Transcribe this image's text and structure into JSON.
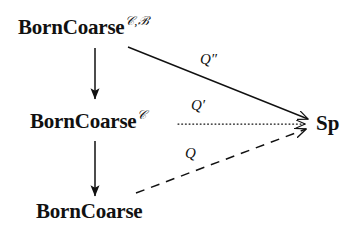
{
  "figure": {
    "type": "commutative-diagram",
    "background_color": "#ffffff",
    "ink_color": "#111111"
  },
  "nodes": [
    {
      "id": "born-coarse-c-b",
      "base": "BornCoarse",
      "superscript": "𝒞,ℬ",
      "position": "top-left"
    },
    {
      "id": "born-coarse-c",
      "base": "BornCoarse",
      "superscript": "𝒞",
      "position": "middle-left"
    },
    {
      "id": "born-coarse",
      "base": "BornCoarse",
      "superscript": "",
      "position": "bottom-left"
    },
    {
      "id": "sp",
      "base": "Sp",
      "superscript": "",
      "position": "right"
    }
  ],
  "edges": [
    {
      "id": "vertical-top",
      "from": "born-coarse-c-b",
      "to": "born-coarse-c",
      "style": "solid",
      "label": ""
    },
    {
      "id": "vertical-bottom",
      "from": "born-coarse-c",
      "to": "born-coarse",
      "style": "solid",
      "label": ""
    },
    {
      "id": "q-double-prime",
      "from": "born-coarse-c-b",
      "to": "sp",
      "style": "solid",
      "label": "Q″"
    },
    {
      "id": "q-prime",
      "from": "born-coarse-c",
      "to": "sp",
      "style": "dotted",
      "label": "Q′"
    },
    {
      "id": "q",
      "from": "born-coarse",
      "to": "sp",
      "style": "dashed",
      "label": "Q"
    }
  ],
  "labels": {
    "q_double_prime": "Q″",
    "q_prime": "Q′",
    "q": "Q"
  }
}
